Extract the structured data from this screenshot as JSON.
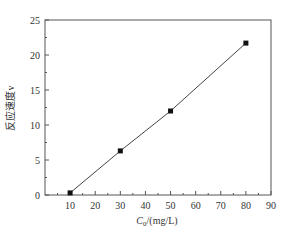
{
  "chart_data": {
    "type": "line",
    "title": "",
    "xlabel": "C0/(mg/L)",
    "xlabel_main": "C",
    "xlabel_sub": "0",
    "xlabel_rest": "/(mg/L)",
    "ylabel": "反应速度v",
    "xlim": [
      0,
      90
    ],
    "ylim": [
      0,
      25
    ],
    "x_ticks": [
      10,
      20,
      30,
      40,
      50,
      60,
      70,
      80,
      90
    ],
    "y_ticks": [
      0,
      5,
      10,
      15,
      20,
      25
    ],
    "grid": false,
    "legend": null,
    "series": [
      {
        "name": "反应速度v",
        "marker": "square",
        "x": [
          10,
          30,
          50,
          80
        ],
        "values": [
          0.3,
          6.3,
          12.0,
          21.7
        ]
      }
    ]
  },
  "colors": {
    "axis": "#555555",
    "line": "#444444",
    "marker": "#111111",
    "text": "#333333"
  }
}
